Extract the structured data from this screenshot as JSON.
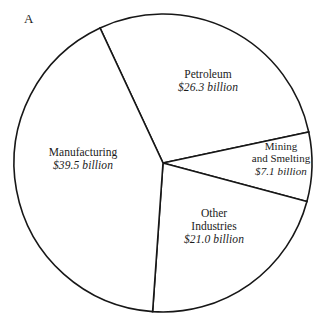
{
  "figure": {
    "panel_label": "A"
  },
  "chart_data": {
    "type": "pie",
    "title": "",
    "subtitle": "",
    "xlabel": "",
    "ylabel": "",
    "units": "billion dollars",
    "total": 93.9,
    "legend_position": "none",
    "grid": false,
    "labels_inside_slices": true,
    "categories": [
      "Petroleum",
      "Mining and Smelting",
      "Other Industries",
      "Manufacturing"
    ],
    "values": [
      26.3,
      7.1,
      21.0,
      39.5
    ],
    "value_labels": [
      "$26.3 billion",
      "$7.1 billion",
      "$21.0 billion",
      "$39.5 billion"
    ],
    "percentages": [
      28.0,
      7.6,
      22.4,
      42.1
    ],
    "start_angle_deg": -25,
    "direction": "clockwise",
    "slices": [
      {
        "name": "Petroleum",
        "name_lines": [
          "Petroleum"
        ],
        "value": 26.3,
        "value_label": "$26.3 billion",
        "percent": 28.0,
        "start_angle_deg": -25,
        "end_angle_deg": 78,
        "fill": "#ffffff",
        "stroke": "#171717"
      },
      {
        "name": "Mining and Smelting",
        "name_lines": [
          "Mining",
          "and Smelting"
        ],
        "value": 7.1,
        "value_label": "$7.1 billion",
        "percent": 7.6,
        "start_angle_deg": 78,
        "end_angle_deg": 105,
        "fill": "#ffffff",
        "stroke": "#171717"
      },
      {
        "name": "Other Industries",
        "name_lines": [
          "Other",
          "Industries"
        ],
        "value": 21.0,
        "value_label": "$21.0 billion",
        "percent": 22.4,
        "start_angle_deg": 105,
        "end_angle_deg": 184,
        "fill": "#ffffff",
        "stroke": "#171717"
      },
      {
        "name": "Manufacturing",
        "name_lines": [
          "Manufacturing"
        ],
        "value": 39.5,
        "value_label": "$39.5 billion",
        "percent": 42.1,
        "start_angle_deg": 184,
        "end_angle_deg": 335,
        "fill": "#ffffff",
        "stroke": "#171717"
      }
    ],
    "geometry": {
      "center_x": 163,
      "center_y": 163,
      "radius": 149
    },
    "colors": {
      "background": "#ffffff",
      "outline": "#171717",
      "text": "#1b1b1b"
    }
  },
  "labels": {
    "petroleum": {
      "line1": "Petroleum",
      "line2": "$26.3 billion"
    },
    "manufacturing": {
      "line1": "Manufacturing",
      "line2": "$39.5 billion"
    },
    "mining": {
      "line1": "Mining",
      "line2": "and Smelting",
      "line3": "$7.1 billion"
    },
    "other": {
      "line1": "Other",
      "line2": "Industries",
      "line3": "$21.0 billion"
    }
  }
}
